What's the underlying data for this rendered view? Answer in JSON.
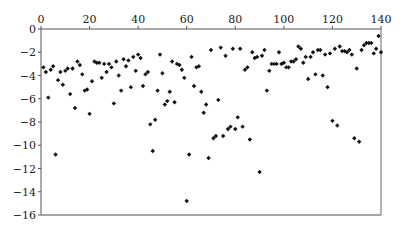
{
  "chart_data": {
    "type": "scatter",
    "title": "",
    "xlabel": "",
    "ylabel": "",
    "xlim": [
      0,
      140
    ],
    "ylim": [
      -16,
      0
    ],
    "x_ticks": [
      0,
      20,
      40,
      60,
      80,
      100,
      120,
      140
    ],
    "y_ticks": [
      0,
      -2,
      -4,
      -6,
      -8,
      -10,
      -12,
      -14,
      -16
    ],
    "x_axis_position": "top",
    "grid": false,
    "legend": null,
    "marker": {
      "shape": "diamond",
      "color": "#111111",
      "size": 2.2
    },
    "axis_color": "#555555",
    "series": [
      {
        "name": "data",
        "points": [
          [
            1,
            -3.3
          ],
          [
            2,
            -3.7
          ],
          [
            3,
            -5.9
          ],
          [
            4,
            -3.5
          ],
          [
            5,
            -3.2
          ],
          [
            6,
            -10.8
          ],
          [
            7,
            -4.4
          ],
          [
            8,
            -3.7
          ],
          [
            9,
            -4.8
          ],
          [
            10,
            -3.6
          ],
          [
            11,
            -3.4
          ],
          [
            12,
            -5.6
          ],
          [
            13,
            -3.4
          ],
          [
            14,
            -6.8
          ],
          [
            15,
            -2.8
          ],
          [
            16,
            -3.1
          ],
          [
            17,
            -3.9
          ],
          [
            18,
            -5.3
          ],
          [
            19,
            -5.2
          ],
          [
            20,
            -7.3
          ],
          [
            21,
            -4.5
          ],
          [
            22,
            -2.8
          ],
          [
            23,
            -2.9
          ],
          [
            24,
            -2.9
          ],
          [
            25,
            -4.2
          ],
          [
            26,
            -3.0
          ],
          [
            27,
            -3.7
          ],
          [
            28,
            -3.0
          ],
          [
            29,
            -3.3
          ],
          [
            30,
            -6.4
          ],
          [
            31,
            -2.8
          ],
          [
            32,
            -4.0
          ],
          [
            33,
            -5.3
          ],
          [
            34,
            -2.6
          ],
          [
            35,
            -3.2
          ],
          [
            36,
            -2.7
          ],
          [
            37,
            -5.0
          ],
          [
            38,
            -2.4
          ],
          [
            39,
            -3.6
          ],
          [
            40,
            -2.2
          ],
          [
            41,
            -2.5
          ],
          [
            42,
            -4.9
          ],
          [
            43,
            -3.9
          ],
          [
            44,
            -3.7
          ],
          [
            45,
            -8.2
          ],
          [
            46,
            -10.5
          ],
          [
            47,
            -7.8
          ],
          [
            48,
            -5.3
          ],
          [
            49,
            -2.2
          ],
          [
            50,
            -3.8
          ],
          [
            51,
            -6.5
          ],
          [
            52,
            -6.2
          ],
          [
            53,
            -5.4
          ],
          [
            54,
            -2.8
          ],
          [
            55,
            -6.3
          ],
          [
            56,
            -3.0
          ],
          [
            57,
            -3.1
          ],
          [
            58,
            -3.5
          ],
          [
            59,
            -4.2
          ],
          [
            60,
            -14.8
          ],
          [
            61,
            -10.8
          ],
          [
            62,
            -2.4
          ],
          [
            63,
            -4.9
          ],
          [
            64,
            -3.3
          ],
          [
            65,
            -3.2
          ],
          [
            66,
            -5.4
          ],
          [
            67,
            -7.2
          ],
          [
            68,
            -6.5
          ],
          [
            69,
            -11.1
          ],
          [
            70,
            -1.8
          ],
          [
            71,
            -9.4
          ],
          [
            72,
            -9.2
          ],
          [
            73,
            -6.1
          ],
          [
            74,
            -1.6
          ],
          [
            75,
            -9.2
          ],
          [
            76,
            -2.3
          ],
          [
            77,
            -8.6
          ],
          [
            78,
            -8.4
          ],
          [
            79,
            -1.7
          ],
          [
            80,
            -8.6
          ],
          [
            81,
            -7.6
          ],
          [
            82,
            -1.7
          ],
          [
            83,
            -8.4
          ],
          [
            84,
            -3.5
          ],
          [
            85,
            -3.3
          ],
          [
            86,
            -9.5
          ],
          [
            87,
            -2.0
          ],
          [
            88,
            -2.5
          ],
          [
            89,
            -2.4
          ],
          [
            90,
            -12.3
          ],
          [
            91,
            -2.3
          ],
          [
            92,
            -1.8
          ],
          [
            93,
            -5.3
          ],
          [
            94,
            -3.6
          ],
          [
            95,
            -3.0
          ],
          [
            96,
            -3.0
          ],
          [
            97,
            -3.0
          ],
          [
            98,
            -2.0
          ],
          [
            99,
            -3.0
          ],
          [
            100,
            -2.9
          ],
          [
            101,
            -3.3
          ],
          [
            102,
            -3.3
          ],
          [
            103,
            -2.8
          ],
          [
            104,
            -2.8
          ],
          [
            105,
            -2.6
          ],
          [
            106,
            -1.5
          ],
          [
            107,
            -1.7
          ],
          [
            108,
            -2.9
          ],
          [
            109,
            -2.4
          ],
          [
            110,
            -4.3
          ],
          [
            111,
            -2.4
          ],
          [
            112,
            -2.0
          ],
          [
            113,
            -3.9
          ],
          [
            114,
            -1.8
          ],
          [
            115,
            -1.8
          ],
          [
            116,
            -4.0
          ],
          [
            117,
            -2.2
          ],
          [
            118,
            -5.0
          ],
          [
            119,
            -2.1
          ],
          [
            120,
            -7.9
          ],
          [
            121,
            -1.7
          ],
          [
            122,
            -8.3
          ],
          [
            123,
            -1.5
          ],
          [
            124,
            -1.9
          ],
          [
            125,
            -1.9
          ],
          [
            126,
            -2.0
          ],
          [
            127,
            -1.8
          ],
          [
            128,
            -2.2
          ],
          [
            129,
            -9.4
          ],
          [
            130,
            -3.4
          ],
          [
            131,
            -9.7
          ],
          [
            132,
            -1.8
          ],
          [
            133,
            -1.4
          ],
          [
            134,
            -1.2
          ],
          [
            135,
            -1.2
          ],
          [
            136,
            -1.2
          ],
          [
            137,
            -2.1
          ],
          [
            138,
            -1.7
          ],
          [
            139,
            -0.6
          ],
          [
            140,
            -2.0
          ]
        ]
      }
    ]
  }
}
